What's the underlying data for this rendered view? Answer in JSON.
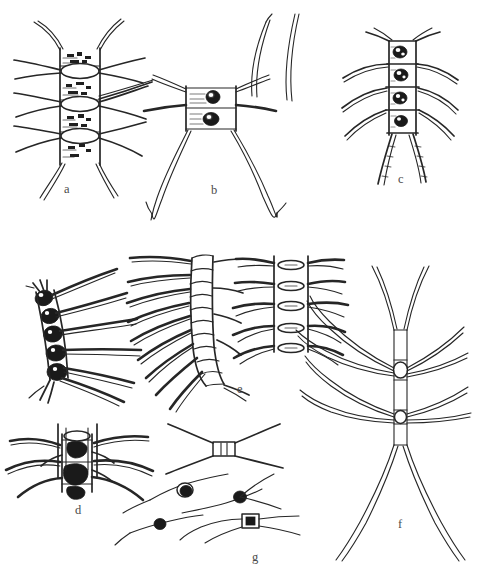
{
  "plate": {
    "title": "Plate of diatom chain-colony line drawings",
    "background_color": "#ffffff",
    "ink_color": "#262626",
    "width": 479,
    "height": 584
  },
  "panels": [
    {
      "id": "a",
      "label": "a",
      "label_x": 64,
      "label_y": 190,
      "description": "Broad chain colony in girdle view; rectangular cells with granular chloroplasts, lens-shaped apertures between cells, paired setae radiating from each junction",
      "cell_count": 4,
      "seta_pairs": 4
    },
    {
      "id": "b",
      "label": "b",
      "label_x": 211,
      "label_y": 191,
      "description": "Two-celled colony with dark rounded chloroplasts and two very long curving terminal setae",
      "cell_count": 2,
      "seta_pairs": 3
    },
    {
      "id": "c",
      "label": "c",
      "label_x": 398,
      "label_y": 180,
      "description": "Narrow four-celled chain with dark granular contents, short lateral setae and two long divergent terminal setae",
      "cell_count": 4,
      "seta_pairs": 4
    },
    {
      "id": "d",
      "label": "d",
      "label_x": 75,
      "label_y": 511,
      "description": "Heavily pigmented chain seen obliquely; dark solid chloroplasts with stout curving setae",
      "cell_count": 5,
      "seta_pairs": 5
    },
    {
      "id": "e",
      "label": "e",
      "label_x": 237,
      "label_y": 390,
      "description": "Left: chain of barrel-shaped cells with fine setae. Right: girdle view showing two parallel valve margins and five lens-shaped apertures with horizontal setae",
      "cell_count": 10,
      "seta_pairs": 9
    },
    {
      "id": "f",
      "label": "f",
      "label_x": 398,
      "label_y": 525,
      "description": "Slender symmetrical colony; narrow hyaline cells with two oval apertures and long gently curved setae, forked terminal setae at both ends",
      "cell_count": 4,
      "seta_pairs": 4
    },
    {
      "id": "g",
      "label": "g",
      "label_x": 252,
      "label_y": 558,
      "description": "Detail of isolated small cells with dark chloroplasts and crossing setae",
      "cell_count": 4,
      "seta_pairs": 4
    }
  ]
}
